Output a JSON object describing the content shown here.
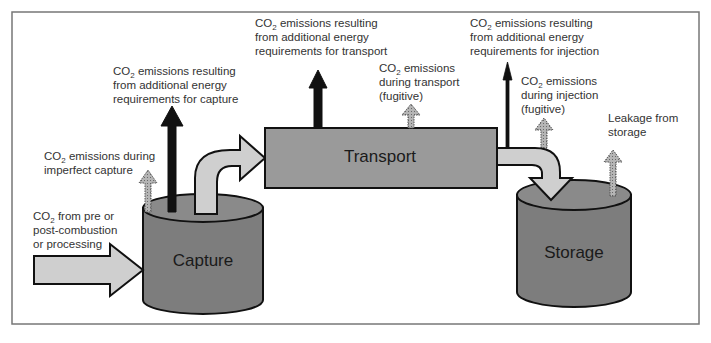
{
  "colors": {
    "frame": "#777777",
    "container_fill": "#7d7d7d",
    "container_top": "#8a8a8a",
    "transport_fill": "#9a9a9a",
    "flow_arrow": "#cfcfcf",
    "energy_arrow": "#111111",
    "fugitive_arrow": "#a8a8a8",
    "text": "#333333"
  },
  "nodes": {
    "capture": "Capture",
    "transport": "Transport",
    "storage": "Storage"
  },
  "labels": {
    "input": {
      "line1_pre": "CO",
      "line1_sub": "2",
      "line1_post": " from pre or",
      "line2": "post-combustion",
      "line3": "or processing"
    },
    "imperfect_capture": {
      "line1_pre": "CO",
      "line1_sub": "2",
      "line1_post": " emissions during",
      "line2": "imperfect capture"
    },
    "energy_capture": {
      "line1_pre": "CO",
      "line1_sub": "2",
      "line1_post": " emissions resulting",
      "line2": "from additional energy",
      "line3": "requirements for capture"
    },
    "energy_transport": {
      "line1_pre": "CO",
      "line1_sub": "2",
      "line1_post": " emissions resulting",
      "line2": "from additional energy",
      "line3": "requirements for transport"
    },
    "fugitive_transport": {
      "line1_pre": "CO",
      "line1_sub": "2",
      "line1_post": " emissions",
      "line2": "during transport",
      "line3": "(fugitive)"
    },
    "energy_injection": {
      "line1_pre": "CO",
      "line1_sub": "2",
      "line1_post": " emissions resulting",
      "line2": "from additional energy",
      "line3": "requirements for injection"
    },
    "fugitive_injection": {
      "line1_pre": "CO",
      "line1_sub": "2",
      "line1_post": " emissions",
      "line2": "during injection",
      "line3": "(fugitive)"
    },
    "leakage": {
      "line1": "Leakage from",
      "line2": "storage"
    }
  }
}
